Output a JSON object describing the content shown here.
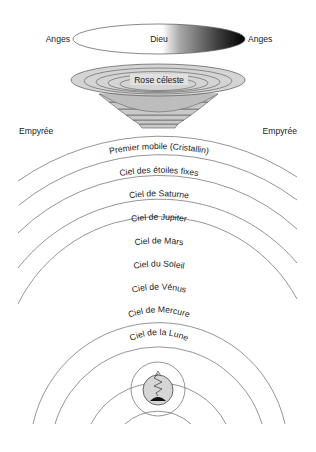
{
  "diagram": {
    "type": "cosmology",
    "colors": {
      "line": "#7a7a7a",
      "bowl": "#c9c9c9",
      "god_gradient_start": "#ffffff",
      "god_gradient_end": "#000000",
      "earth": "#d6d6d6"
    },
    "god": {
      "label": "Dieu",
      "left_label": "Anges",
      "right_label": "Anges"
    },
    "rose": {
      "label": "Rose céleste"
    },
    "empyrean": {
      "left_label": "Empyrée",
      "right_label": "Empyrée"
    },
    "spheres": [
      {
        "label": "Premier mobile (Cristallin)"
      },
      {
        "label": "Ciel des étoiles fixes"
      },
      {
        "label": "Ciel de Saturne"
      },
      {
        "label": "Ciel de Jupiter"
      },
      {
        "label": "Ciel de Mars"
      },
      {
        "label": "Ciel du Soleil"
      },
      {
        "label": "Ciel de Vénus"
      },
      {
        "label": "Ciel de Mercure"
      },
      {
        "label": "Ciel de la Lune"
      }
    ],
    "earth": {
      "icon": "earth-with-purgatory-mountain-icon"
    }
  }
}
